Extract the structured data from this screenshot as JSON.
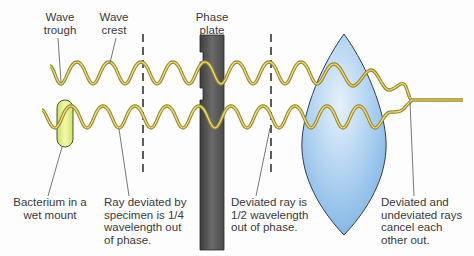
{
  "figure": {
    "title_clipped": "(title text cut off at top edge)",
    "labels": {
      "wave_trough": [
        "Wave",
        "trough"
      ],
      "wave_crest": [
        "Wave",
        "crest"
      ],
      "phase_plate": [
        "Phase",
        "plate"
      ],
      "bacterium": [
        "Bacterium in a",
        "wet mount"
      ],
      "ray_deviated": [
        "Ray deviated by",
        "specimen is 1/4",
        "wavelength out",
        "of phase."
      ],
      "deviated_half": [
        "Deviated ray is",
        "1/2 wavelength",
        "out of phase."
      ],
      "cancel": [
        "Deviated and",
        "undeviated rays",
        "cancel each",
        "other out."
      ]
    },
    "colors": {
      "wave_stroke": "#b5a33a",
      "wave_core": "#e8d88a",
      "phase_plate": "#5a5a5a",
      "lens_fill": "#9cc6ec",
      "lens_stroke": "#2f3e55",
      "bacterium_fill": "#e6ef8a",
      "dashed_line": "#333333",
      "leader_line": "#555555",
      "text": "#3a3a3a"
    }
  }
}
